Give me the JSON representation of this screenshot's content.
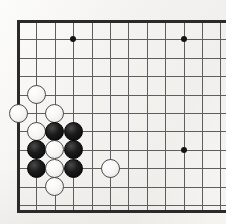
{
  "figure": {
    "kind": "go-board-diagram",
    "board_size": 19,
    "visible_region": "top-left corner, cropped at right edge",
    "background_color": "#f4f3f1",
    "line_color": "#5e5e5e",
    "edge_line_color": "#2a2a2a",
    "black_stone_color": "#0a0a0a",
    "white_stone_color": "#f7f6f4",
    "white_stone_outline_color": "#4b4b4b"
  },
  "geometry": {
    "origin_x": 18,
    "origin_y": 21,
    "spacing": 18.4,
    "columns_visible": 12,
    "rows_visible": 11,
    "stone_diameter": 19,
    "bottom_edge_y": 210
  },
  "star_points": [
    {
      "name": "hoshi-d16",
      "col": 3,
      "row": 1
    },
    {
      "name": "hoshi-k16",
      "col": 9,
      "row": 1
    },
    {
      "name": "hoshi-k10",
      "col": 9,
      "row": 7
    }
  ],
  "stones": [
    {
      "id": 1,
      "color": "white",
      "col": 1,
      "row": 4,
      "label": "white-stone-c-upper"
    },
    {
      "id": 2,
      "color": "white",
      "col": 0,
      "row": 5,
      "label": "white-stone-left-edge"
    },
    {
      "id": 3,
      "color": "white",
      "col": 2,
      "row": 5,
      "label": "white-stone-right-of-edge"
    },
    {
      "id": 4,
      "color": "white",
      "col": 1,
      "row": 6,
      "label": "white-stone-cluster-top-left"
    },
    {
      "id": 5,
      "color": "black",
      "col": 2,
      "row": 6,
      "label": "black-stone-cluster-top-mid"
    },
    {
      "id": 6,
      "color": "black",
      "col": 3,
      "row": 6,
      "label": "black-stone-cluster-top-right"
    },
    {
      "id": 7,
      "color": "black",
      "col": 1,
      "row": 7,
      "label": "black-stone-cluster-mid-left"
    },
    {
      "id": 8,
      "color": "white",
      "col": 2,
      "row": 7,
      "label": "white-stone-cluster-center"
    },
    {
      "id": 9,
      "color": "black",
      "col": 3,
      "row": 7,
      "label": "black-stone-cluster-mid-right"
    },
    {
      "id": 10,
      "color": "black",
      "col": 1,
      "row": 8,
      "label": "black-stone-cluster-low-left"
    },
    {
      "id": 11,
      "color": "white",
      "col": 2,
      "row": 8,
      "label": "white-stone-cluster-low-mid"
    },
    {
      "id": 12,
      "color": "black",
      "col": 3,
      "row": 8,
      "label": "black-stone-cluster-low-right"
    },
    {
      "id": 13,
      "color": "white",
      "col": 5,
      "row": 8,
      "label": "white-stone-right-extension"
    },
    {
      "id": 14,
      "color": "white",
      "col": 2,
      "row": 9,
      "label": "white-stone-bottom"
    }
  ]
}
